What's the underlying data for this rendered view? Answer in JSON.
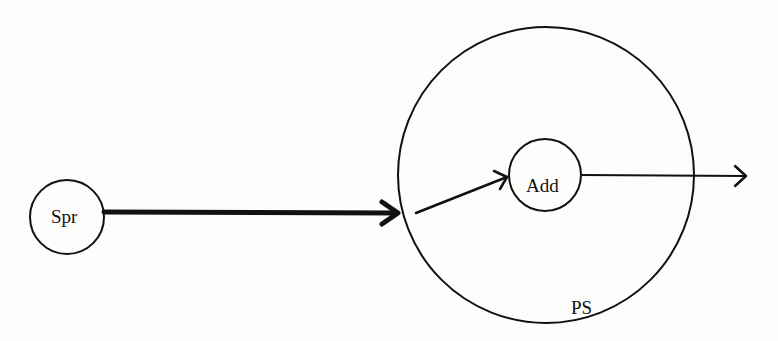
{
  "diagram": {
    "nodes": [
      {
        "id": "spr",
        "label": "Spr",
        "shape": "circle"
      },
      {
        "id": "ps",
        "label": "PS",
        "shape": "circle",
        "role": "container"
      },
      {
        "id": "add",
        "label": "Add",
        "shape": "circle",
        "parent": "ps"
      }
    ],
    "edges": [
      {
        "from": "spr",
        "to": "ps",
        "style": "thick"
      },
      {
        "from": "ps",
        "to": "add",
        "style": "thin"
      },
      {
        "from": "add",
        "to": "output",
        "style": "thin"
      }
    ],
    "colors": {
      "stroke": "#111111",
      "background": "#fdfdfb"
    }
  }
}
